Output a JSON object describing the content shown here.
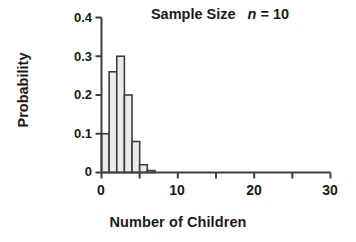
{
  "chart_data": {
    "type": "bar",
    "title": "Sample Size  n = 10",
    "title_prefix": "Sample Size",
    "title_var": "n",
    "title_suffix": "= 10",
    "xlabel": "Number of Children",
    "ylabel": "Probability",
    "categories": [
      0,
      1,
      2,
      3,
      4,
      5,
      6
    ],
    "values": [
      0.1,
      0.26,
      0.3,
      0.2,
      0.08,
      0.02,
      0.005
    ],
    "x": [
      0,
      1,
      2,
      3,
      4,
      5,
      6
    ],
    "xlim": [
      0,
      30
    ],
    "ylim": [
      0,
      0.4
    ],
    "xticks": [
      0,
      5,
      10,
      15,
      20,
      25,
      30
    ],
    "xtick_labels": [
      "0",
      "",
      "10",
      "",
      "20",
      "",
      "30"
    ],
    "yticks": [
      0,
      0.1,
      0.2,
      0.3,
      0.4
    ],
    "ytick_labels": [
      "0",
      "0.1",
      "0.2",
      "0.3",
      "0.4"
    ],
    "grid": false,
    "legend": "none",
    "bar_fill": "#ebebeb",
    "bar_edge": "#3d3d3d",
    "axis_color": "#3d3d3d"
  },
  "axes": {
    "y_labels": [
      "0.4",
      "0.3",
      "0.2",
      "0.1",
      "0"
    ],
    "x_labels": [
      "0",
      "10",
      "20",
      "30"
    ]
  },
  "labels": {
    "title_prefix": "Sample Size",
    "title_var": "n",
    "title_suffix": "= 10",
    "xlabel": "Number of Children",
    "ylabel": "Probability"
  }
}
